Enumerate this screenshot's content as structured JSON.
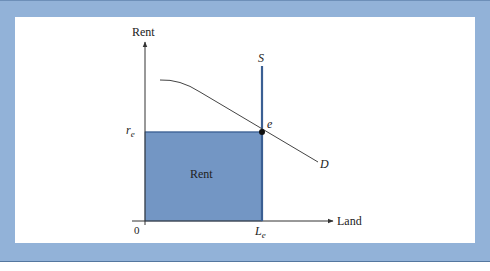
{
  "diagram": {
    "y_axis_label": "Rent",
    "x_axis_label": "Land",
    "origin_label": "0",
    "supply_label": "S",
    "demand_label": "D",
    "equilibrium_label": "e",
    "rent_price_label": "r",
    "rent_price_subscript": "e",
    "land_quantity_label": "L",
    "land_quantity_subscript": "e",
    "area_label": "Rent"
  },
  "colors": {
    "frame": "#92b2d8",
    "rent_area": "#7396c4",
    "supply_line": "#3a5f93",
    "axis": "#333333"
  }
}
